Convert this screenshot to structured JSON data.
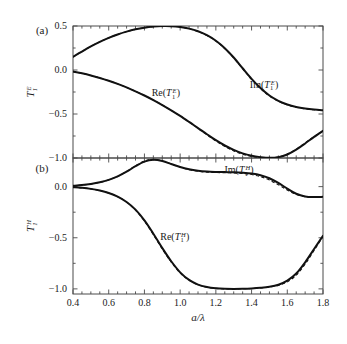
{
  "figure": {
    "panels": [
      {
        "letter": "(a)",
        "ylabel_base": "T",
        "ylabel_sub": "1",
        "ylabel_sup": "E",
        "yticks": [
          "0.5",
          "0.0",
          "-0.5",
          "-1.0"
        ],
        "ytick_values": [
          0.5,
          0.0,
          -0.5,
          -1.0
        ],
        "ylim": [
          -1.0,
          0.5
        ],
        "curve_labels": [
          {
            "name": "re-label",
            "prefix": "Re(",
            "base": "T",
            "sub": "1",
            "sup": "E",
            "suffix": ")"
          },
          {
            "name": "im-label",
            "prefix": "Im(",
            "base": "T",
            "sub": "1",
            "sup": "E",
            "suffix": ")"
          }
        ]
      },
      {
        "letter": "(b)",
        "ylabel_base": "T",
        "ylabel_sub": "1",
        "ylabel_sup": "H",
        "yticks": [
          "0.0",
          "-0.5",
          "-1.0"
        ],
        "ytick_values": [
          0.0,
          -0.5,
          -1.0
        ],
        "ylim": [
          -1.05,
          0.28
        ],
        "curve_labels": [
          {
            "name": "re-label",
            "prefix": "Re(",
            "base": "T",
            "sub": "1",
            "sup": "H",
            "suffix": ")"
          },
          {
            "name": "im-label",
            "prefix": "Im(",
            "base": "T",
            "sub": "1",
            "sup": "H",
            "suffix": ")"
          }
        ]
      }
    ],
    "xaxis": {
      "label_num": "a",
      "label_slash": "/",
      "label_den": "λ",
      "ticks": [
        "0.4",
        "0.6",
        "0.8",
        "1.0",
        "1.2",
        "1.4",
        "1.6",
        "1.8"
      ],
      "tick_values": [
        0.4,
        0.6,
        0.8,
        1.0,
        1.2,
        1.4,
        1.6,
        1.8
      ],
      "xlim": [
        0.4,
        1.8
      ],
      "minor_step": 0.05
    },
    "colors": {
      "curve": "#111111",
      "frame": "#4a4a4a",
      "background": "#ffffff",
      "text": "#1a1a1a"
    }
  },
  "chart_data": {
    "type": "line",
    "title": "",
    "subtitle": "",
    "xlabel": "a/λ",
    "grid": false,
    "legend": "inline-annotations",
    "panels": [
      {
        "id": "a",
        "letter": "(a)",
        "ylabel": "T_1^E",
        "xlim": [
          0.4,
          1.8
        ],
        "ylim": [
          -1.0,
          0.5
        ],
        "xticks": [
          0.4,
          0.6,
          0.8,
          1.0,
          1.2,
          1.4,
          1.6,
          1.8
        ],
        "yticks": [
          0.5,
          0.0,
          -0.5,
          -1.0
        ],
        "x": [
          0.4,
          0.45,
          0.5,
          0.55,
          0.6,
          0.65,
          0.7,
          0.75,
          0.8,
          0.85,
          0.9,
          0.95,
          1.0,
          1.05,
          1.1,
          1.15,
          1.2,
          1.25,
          1.3,
          1.35,
          1.4,
          1.45,
          1.5,
          1.55,
          1.6,
          1.65,
          1.7,
          1.75,
          1.8
        ],
        "series": [
          {
            "name": "Im(T_1^E)",
            "style": "solid",
            "values": [
              0.15,
              0.21,
              0.268,
              0.32,
              0.365,
              0.404,
              0.436,
              0.462,
              0.481,
              0.493,
              0.499,
              0.498,
              0.489,
              0.47,
              0.44,
              0.395,
              0.332,
              0.248,
              0.142,
              0.02,
              -0.1,
              -0.205,
              -0.29,
              -0.35,
              -0.392,
              -0.42,
              -0.438,
              -0.45,
              -0.458
            ]
          },
          {
            "name": "Im(T_1^E) exact",
            "style": "dashed",
            "values": [
              0.15,
              0.21,
              0.268,
              0.32,
              0.365,
              0.404,
              0.436,
              0.462,
              0.481,
              0.493,
              0.499,
              0.498,
              0.489,
              0.47,
              0.438,
              0.392,
              0.328,
              0.243,
              0.136,
              0.014,
              -0.106,
              -0.212,
              -0.296,
              -0.355,
              -0.396,
              -0.424,
              -0.441,
              -0.452,
              -0.46
            ]
          },
          {
            "name": "Re(T_1^E)",
            "style": "solid",
            "values": [
              -0.018,
              -0.038,
              -0.062,
              -0.09,
              -0.122,
              -0.158,
              -0.198,
              -0.242,
              -0.29,
              -0.342,
              -0.398,
              -0.458,
              -0.522,
              -0.59,
              -0.66,
              -0.73,
              -0.798,
              -0.858,
              -0.908,
              -0.948,
              -0.975,
              -0.99,
              -0.998,
              -0.99,
              -0.96,
              -0.905,
              -0.835,
              -0.76,
              -0.692
            ]
          },
          {
            "name": "Re(T_1^E) exact",
            "style": "dashed",
            "values": [
              -0.018,
              -0.038,
              -0.062,
              -0.09,
              -0.122,
              -0.158,
              -0.198,
              -0.242,
              -0.29,
              -0.342,
              -0.398,
              -0.458,
              -0.522,
              -0.592,
              -0.664,
              -0.736,
              -0.806,
              -0.868,
              -0.92,
              -0.958,
              -0.982,
              -0.996,
              -1.0,
              -0.988,
              -0.956,
              -0.9,
              -0.83,
              -0.756,
              -0.69
            ]
          }
        ],
        "annotations": [
          {
            "text": "Re(T_1^E)",
            "x": 0.92,
            "y": -0.3
          },
          {
            "text": "Im(T_1^E)",
            "x": 1.47,
            "y": -0.2
          }
        ]
      },
      {
        "id": "b",
        "letter": "(b)",
        "ylabel": "T_1^H",
        "xlim": [
          0.4,
          1.8
        ],
        "ylim": [
          -1.05,
          0.28
        ],
        "xticks": [
          0.4,
          0.6,
          0.8,
          1.0,
          1.2,
          1.4,
          1.6,
          1.8
        ],
        "yticks": [
          0.0,
          -0.5,
          -1.0
        ],
        "x": [
          0.4,
          0.45,
          0.5,
          0.55,
          0.6,
          0.65,
          0.7,
          0.75,
          0.8,
          0.85,
          0.9,
          0.95,
          1.0,
          1.05,
          1.1,
          1.15,
          1.2,
          1.25,
          1.3,
          1.35,
          1.4,
          1.45,
          1.5,
          1.55,
          1.6,
          1.65,
          1.7,
          1.75,
          1.8
        ],
        "series": [
          {
            "name": "Im(T_1^H)",
            "style": "solid",
            "values": [
              0.008,
              0.015,
              0.026,
              0.042,
              0.066,
              0.1,
              0.146,
              0.2,
              0.245,
              0.262,
              0.25,
              0.222,
              0.192,
              0.17,
              0.156,
              0.148,
              0.144,
              0.142,
              0.14,
              0.136,
              0.128,
              0.112,
              0.082,
              0.036,
              -0.02,
              -0.07,
              -0.096,
              -0.102,
              -0.1
            ]
          },
          {
            "name": "Im(T_1^H) exact",
            "style": "dashed",
            "values": [
              0.008,
              0.015,
              0.026,
              0.042,
              0.066,
              0.1,
              0.148,
              0.204,
              0.25,
              0.266,
              0.252,
              0.222,
              0.19,
              0.166,
              0.15,
              0.142,
              0.138,
              0.136,
              0.134,
              0.128,
              0.118,
              0.098,
              0.064,
              0.018,
              -0.034,
              -0.076,
              -0.098,
              -0.102,
              -0.1
            ]
          },
          {
            "name": "Re(T_1^H)",
            "style": "solid",
            "values": [
              -0.006,
              -0.012,
              -0.022,
              -0.038,
              -0.062,
              -0.098,
              -0.15,
              -0.225,
              -0.33,
              -0.46,
              -0.6,
              -0.73,
              -0.838,
              -0.912,
              -0.958,
              -0.982,
              -0.994,
              -0.999,
              -1.0,
              -0.999,
              -0.996,
              -0.99,
              -0.98,
              -0.96,
              -0.92,
              -0.85,
              -0.74,
              -0.61,
              -0.48
            ]
          },
          {
            "name": "Re(T_1^H) exact",
            "style": "dashed",
            "values": [
              -0.006,
              -0.012,
              -0.022,
              -0.038,
              -0.062,
              -0.098,
              -0.152,
              -0.23,
              -0.338,
              -0.47,
              -0.61,
              -0.738,
              -0.844,
              -0.916,
              -0.96,
              -0.983,
              -0.995,
              -1.0,
              -1.0,
              -0.999,
              -0.996,
              -0.99,
              -0.982,
              -0.966,
              -0.932,
              -0.866,
              -0.758,
              -0.624,
              -0.488
            ]
          }
        ],
        "annotations": [
          {
            "text": "Re(T_1^H)",
            "x": 0.97,
            "y": -0.52
          },
          {
            "text": "Im(T_1^H)",
            "x": 1.33,
            "y": 0.13
          }
        ]
      }
    ]
  }
}
